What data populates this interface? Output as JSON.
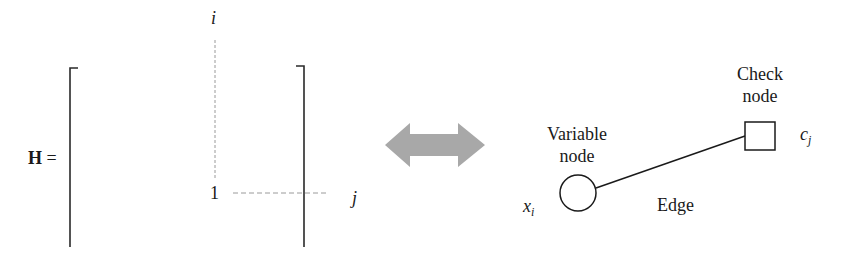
{
  "matrix": {
    "lhs_label": "H",
    "equals": "=",
    "row_index_label": "i",
    "col_index_label": "j",
    "entry_value": "1"
  },
  "arrow": {
    "type": "double-headed",
    "color": "#a8a8a8"
  },
  "graph": {
    "variable_node": {
      "label_line1": "Variable",
      "label_line2": "node",
      "symbol": "x",
      "symbol_sub": "i",
      "shape": "circle"
    },
    "check_node": {
      "label_line1": "Check",
      "label_line2": "node",
      "symbol": "c",
      "symbol_sub": "j",
      "shape": "square"
    },
    "edge": {
      "label": "Edge"
    }
  },
  "colors": {
    "stroke": "#1a1a1a",
    "dashed_guide": "#9a9a9a",
    "arrow_fill": "#a8a8a8",
    "background": "#ffffff"
  }
}
